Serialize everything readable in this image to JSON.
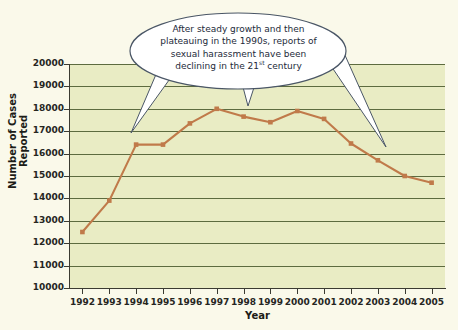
{
  "chart_data": {
    "type": "line",
    "title": "",
    "xlabel": "Year",
    "ylabel": "Number of Cases Reported",
    "categories": [
      1992,
      1993,
      1994,
      1995,
      1996,
      1997,
      1998,
      1999,
      2000,
      2001,
      2002,
      2003,
      2004,
      2005
    ],
    "xtick_labels": [
      "1992",
      "1993",
      "1994",
      "1995",
      "1996",
      "1997",
      "1998",
      "1999",
      "2000",
      "2001",
      "2002",
      "2003",
      "2004",
      "2005"
    ],
    "values": [
      12500,
      13900,
      16400,
      16400,
      17350,
      18000,
      17650,
      17400,
      17900,
      17550,
      16450,
      15700,
      15000,
      14700
    ],
    "ytick_labels": [
      "10000",
      "11000",
      "12000",
      "13000",
      "14000",
      "15000",
      "16000",
      "17000",
      "18000",
      "19000",
      "20000"
    ],
    "ytick_values": [
      10000,
      11000,
      12000,
      13000,
      14000,
      15000,
      16000,
      17000,
      18000,
      19000,
      20000
    ],
    "ylim": [
      10000,
      20000
    ],
    "xlim": [
      1991.5,
      2005.5
    ],
    "grid": true,
    "legend": "none",
    "series_color": "#c07a4a",
    "marker": "square",
    "annotations": [
      {
        "name": "callout",
        "text_line_1": "After steady growth and then",
        "text_line_2": "plateauing in the 1990s, reports of",
        "text_line_3": "sexual harassment have been",
        "text_line_4_a": "declining in the 21",
        "text_line_4_sup": "st",
        "text_line_4_b": " century",
        "pointer_targets": [
          1994,
          1998,
          2003
        ]
      }
    ]
  },
  "colors": {
    "figure_background": "#faf9ea",
    "plot_background": "#e9ecc4",
    "gridline": "#5d6b3f",
    "axis": "#3b3b32",
    "series": "#c07a4a",
    "callout_fill": "#ffffff",
    "callout_stroke": "#4a5666",
    "callout_text": "#1d2a3a",
    "tick_text": "#26261f"
  }
}
